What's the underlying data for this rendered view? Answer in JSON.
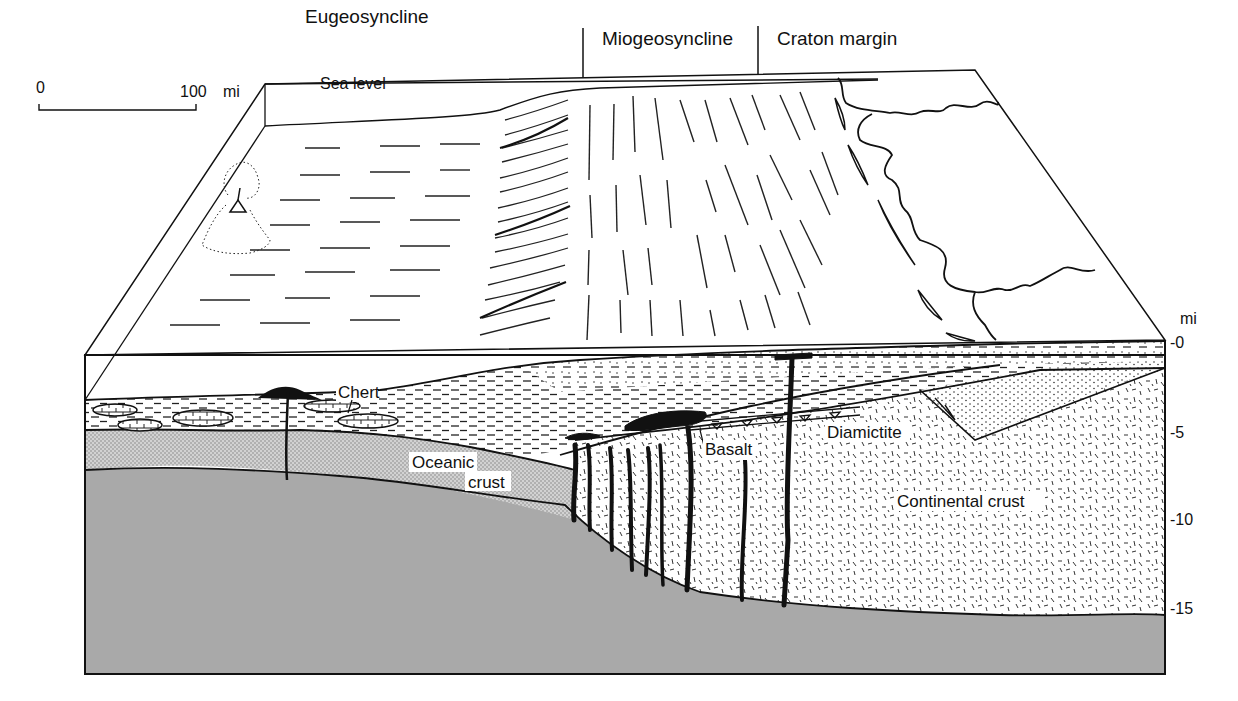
{
  "diagram": {
    "zones": [
      {
        "label": "Eugeosyncline"
      },
      {
        "label": "Miogeosyncline"
      },
      {
        "label": "Craton margin"
      }
    ],
    "scale_bar": {
      "start": "0",
      "end": "100",
      "unit": "mi"
    },
    "sea_level_label": "Sea level",
    "depth_axis": {
      "unit": "mi",
      "ticks": [
        "-0",
        "-5",
        "-10",
        "-15"
      ]
    },
    "rock_labels": {
      "chert": "Chert",
      "oceanic_crust_1": "Oceanic",
      "oceanic_crust_2": "crust",
      "basalt": "Basalt",
      "diamictite": "Diamictite",
      "continental_crust": "Continental crust"
    },
    "colors": {
      "mantle": "#a9a9a9",
      "oceanic_crust": "#cdcdcd",
      "line": "#111111",
      "background": "#ffffff"
    }
  }
}
